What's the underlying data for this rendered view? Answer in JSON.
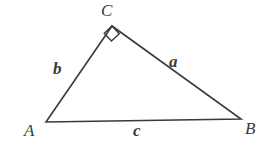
{
  "figure": {
    "type": "right-triangle-diagram",
    "background_color": "#ffffff",
    "stroke_color": "#3a3a3a",
    "stroke_width": 1.6,
    "text_color": "#3a3a3a",
    "vertices": [
      {
        "id": "C",
        "label": "C",
        "x": 112,
        "y": 26,
        "label_x": 101,
        "label_y": 2
      },
      {
        "id": "A",
        "label": "A",
        "x": 46,
        "y": 122,
        "label_x": 24,
        "label_y": 122
      },
      {
        "id": "B",
        "label": "B",
        "x": 241,
        "y": 119,
        "label_x": 245,
        "label_y": 120
      }
    ],
    "sides": [
      {
        "id": "a",
        "label": "a",
        "from": "C",
        "to": "B",
        "label_x": 169,
        "label_y": 53
      },
      {
        "id": "b",
        "label": "b",
        "from": "A",
        "to": "C",
        "label_x": 53,
        "label_y": 60
      },
      {
        "id": "c",
        "label": "c",
        "from": "A",
        "to": "B",
        "label_x": 133,
        "label_y": 122
      }
    ],
    "right_angle_marker": {
      "at_vertex": "C",
      "size": 13,
      "points": "104.2,33.2 112,26 119.3,33.8 111.5,41.0"
    },
    "polygon_points": "46,122 112,26 241,119"
  }
}
